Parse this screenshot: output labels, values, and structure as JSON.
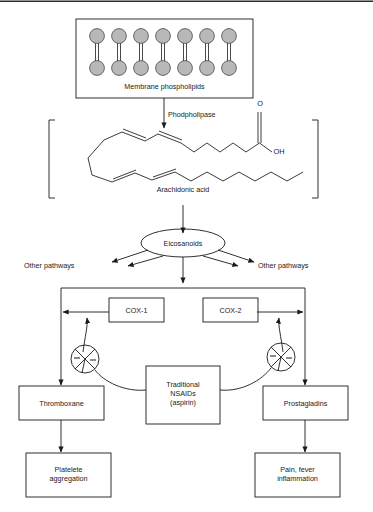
{
  "diagram": {
    "accent_color": "#1a1a1a",
    "membrane_fill": "#b8b8b8",
    "background": "#ffffff"
  },
  "nodes": {
    "membrane": {
      "label": "Membrane phospholipids",
      "head_count": 7,
      "leaflets": 2
    },
    "enzyme": {
      "label": "Phodpholipase"
    },
    "arachidonic": {
      "label": "Arachidonic acid",
      "carboxyl_o": "O",
      "carboxyl_oh": "OH"
    },
    "eicosanoids": {
      "label": "Eicosanoids"
    },
    "other_left": {
      "label": "Other pathways"
    },
    "other_right": {
      "label": "Other pathways"
    },
    "cox1": {
      "label": "COX-1"
    },
    "cox2": {
      "label": "COX-2"
    },
    "nsaids": {
      "label": "Traditional\nNSAIDs\n(aspirin)"
    },
    "thromboxane": {
      "label": "Thromboxane"
    },
    "prostagladins": {
      "label": "Prostagladins"
    },
    "platelet": {
      "label": "Platelete\naggregation"
    },
    "pain": {
      "label": "Pain, fever\ninflammation"
    }
  },
  "inhibition_markers": {
    "left": {
      "sign": "−",
      "name": "inhibition-circle-cox1"
    },
    "right": {
      "sign": "−",
      "name": "inhibition-circle-cox2"
    }
  }
}
